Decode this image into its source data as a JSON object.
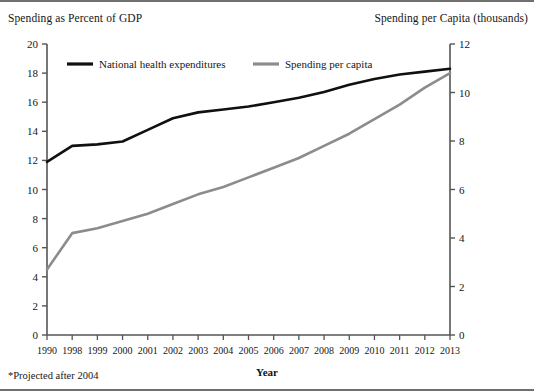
{
  "figure": {
    "left_axis_caption": "Spending as Percent of GDP",
    "right_axis_caption": "Spending per Capita (thousands)",
    "footnote": "*Projected after 2004",
    "frame_color": "#707070",
    "background": "#ffffff"
  },
  "chart_data": {
    "type": "line",
    "title": "",
    "xlabel": "Year",
    "ylabel": "Spending as Percent of GDP",
    "y2label": "Spending per Capita (thousands)",
    "categories": [
      "1990",
      "1998",
      "1999",
      "2000",
      "2001",
      "2002",
      "2003",
      "2004",
      "2005",
      "2006",
      "2007",
      "2008",
      "2009",
      "2010",
      "2011",
      "2012",
      "2013"
    ],
    "ylim": [
      0,
      20
    ],
    "yticks": [
      0,
      2,
      4,
      6,
      8,
      10,
      12,
      14,
      16,
      18,
      20
    ],
    "y2lim": [
      0,
      12
    ],
    "y2ticks": [
      0,
      2,
      4,
      6,
      8,
      10,
      12
    ],
    "grid": false,
    "legend_position": "top-inside",
    "series": [
      {
        "name": "National health expenditures",
        "axis": "left",
        "color": "#101010",
        "width": 2.6,
        "values": [
          11.9,
          13.0,
          13.1,
          13.3,
          14.1,
          14.9,
          15.3,
          15.5,
          15.7,
          16.0,
          16.3,
          16.7,
          17.2,
          17.6,
          17.9,
          18.1,
          18.3
        ]
      },
      {
        "name": "Spending per capita",
        "axis": "right",
        "color": "#8c8c8c",
        "width": 2.6,
        "values": [
          2.7,
          4.2,
          4.4,
          4.7,
          5.0,
          5.4,
          5.8,
          6.1,
          6.5,
          6.9,
          7.3,
          7.8,
          8.3,
          8.9,
          9.5,
          10.2,
          10.8
        ]
      }
    ]
  }
}
